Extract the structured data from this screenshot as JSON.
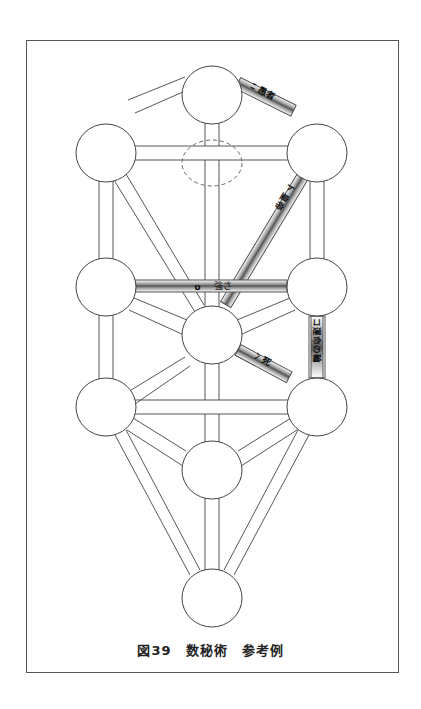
{
  "figure": {
    "caption": "図39　数秘術　参考例"
  },
  "colors": {
    "line": "#444444",
    "highlight_path_fill": "#bdbdbd",
    "frame": "#555555",
    "background": "#ffffff"
  },
  "nodes": [
    {
      "id": "kether",
      "x": 212,
      "y": 95
    },
    {
      "id": "binah",
      "x": 106,
      "y": 153
    },
    {
      "id": "chokmah",
      "x": 317,
      "y": 153
    },
    {
      "id": "geburah",
      "x": 106,
      "y": 287
    },
    {
      "id": "chesed",
      "x": 317,
      "y": 287
    },
    {
      "id": "tiphareth",
      "x": 212,
      "y": 335
    },
    {
      "id": "hod",
      "x": 106,
      "y": 407
    },
    {
      "id": "netzach",
      "x": 317,
      "y": 407
    },
    {
      "id": "yesod",
      "x": 212,
      "y": 470
    },
    {
      "id": "malkuth",
      "x": 212,
      "y": 598
    }
  ],
  "hidden_node": {
    "id": "daath",
    "x": 212,
    "y": 163,
    "style": "dashed"
  },
  "highlighted_paths": [
    {
      "from": "kether",
      "to": "chokmah",
      "letter": "ﾆ",
      "label": "ᒥ 愚者",
      "text": "7 愚者"
    },
    {
      "from": "chokmah",
      "to": "tiphareth",
      "letter": "ト",
      "label": "ﾄ 皇帝",
      "text": "ト 皇帝"
    },
    {
      "from": "geburah",
      "to": "chesed",
      "letter": "ט",
      "label": "強さ",
      "text": "ט　強さ"
    },
    {
      "from": "chesed",
      "to": "netzach",
      "letter": "כ",
      "label": "運命の輪",
      "text": "コ 運命の輪"
    },
    {
      "from": "tiphareth",
      "to": "netzach",
      "letter": "נ",
      "label": "死",
      "text": "ﾝ 死"
    }
  ],
  "path_labels": {
    "p1": "ﾆ 愚者",
    "p2": "ト 皇帝",
    "p3_letter": "ט",
    "p3_word": "強さ",
    "p4": "コ運命の輪",
    "p5": "ﾝ 死"
  }
}
